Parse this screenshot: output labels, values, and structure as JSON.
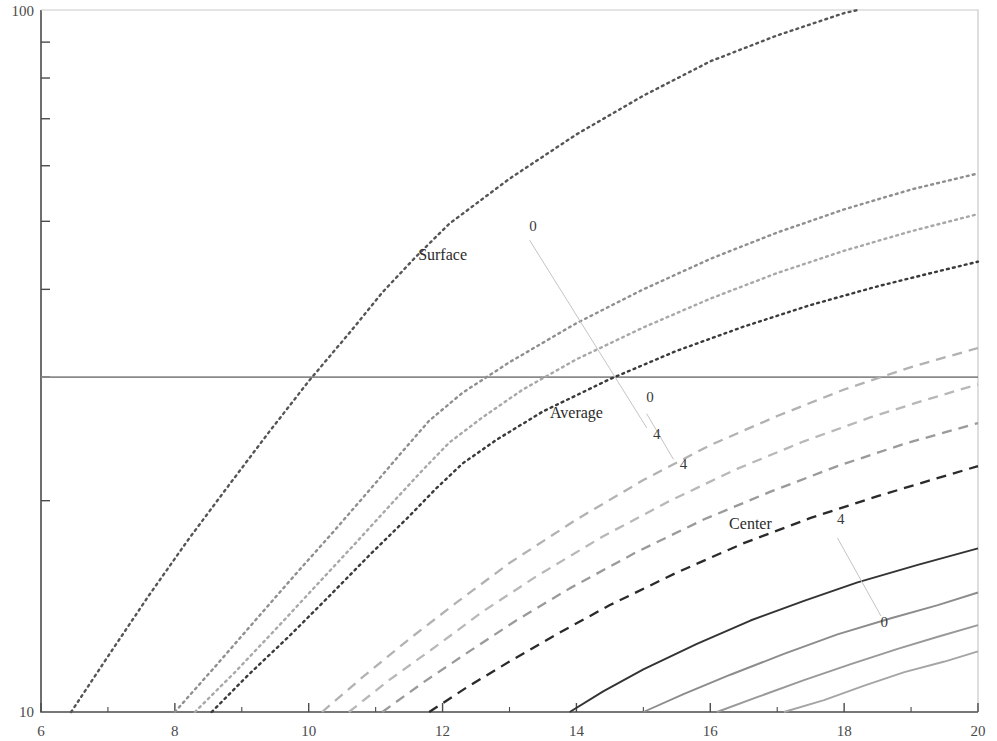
{
  "chart_data": {
    "type": "line",
    "title": "",
    "xlabel": "",
    "ylabel": "",
    "xlim": [
      6,
      20
    ],
    "ylim": [
      10,
      100
    ],
    "yscale": "log",
    "xscale": "linear",
    "grid": false,
    "legend_position": "inline-annotations",
    "x_ticks": [
      6,
      8,
      10,
      12,
      14,
      16,
      18,
      20
    ],
    "x_tick_labels": [
      "6",
      "8",
      "10",
      "12",
      "14",
      "16",
      "18",
      "20"
    ],
    "x_minor_ticks": [
      7,
      9,
      11,
      13,
      15,
      17,
      19
    ],
    "y_ticks": [
      10,
      100
    ],
    "y_tick_labels": [
      "10",
      "100"
    ],
    "y_minor_ticks": [
      20,
      30,
      40,
      50,
      60,
      70,
      80,
      90
    ],
    "reference_line": {
      "y": 30,
      "orientation": "horizontal",
      "color": "#8a8a8a"
    },
    "groups": [
      {
        "name": "Surface",
        "label": "Surface",
        "linestyle": "dotted",
        "label_x": 12.0,
        "label_y": 44.0,
        "tag_high": "0",
        "tag_high_x": 13.35,
        "tag_high_y": 48.5,
        "tag_low": "4",
        "tag_low_x": 15.2,
        "tag_low_y": 24.5,
        "series": [
          {
            "name": "0",
            "color": "#555555",
            "x": [
              6.45,
              7.0,
              7.6,
              8.2,
              8.8,
              9.4,
              10.0,
              10.6,
              11.1,
              11.6,
              12.1,
              13.0,
              14.0,
              15.0,
              16.0,
              17.0,
              18.0,
              19.0,
              20.0
            ],
            "y": [
              10.0,
              12.0,
              14.6,
              17.6,
              21.0,
              25.0,
              29.6,
              34.6,
              39.6,
              44.5,
              49.6,
              57.5,
              66.5,
              75.5,
              84.5,
              92.0,
              99.0,
              104.0,
              108.0
            ]
          },
          {
            "name": "1",
            "color": "#8f8f8f",
            "x": [
              8.0,
              8.6,
              9.2,
              9.8,
              10.4,
              11.0,
              11.4,
              11.8,
              12.3,
              13.0,
              14.0,
              15.0,
              16.0,
              17.0,
              18.0,
              19.0,
              20.0
            ],
            "y": [
              10.0,
              11.6,
              13.5,
              15.7,
              18.2,
              21.2,
              23.5,
              26.0,
              28.5,
              31.5,
              35.8,
              40.0,
              44.2,
              48.2,
              52.0,
              55.5,
              58.5
            ]
          },
          {
            "name": "2",
            "color": "#a8a8a8",
            "x": [
              8.3,
              8.9,
              9.5,
              10.1,
              10.7,
              11.3,
              11.7,
              12.1,
              12.6,
              13.2,
              14.0,
              15.0,
              16.0,
              17.0,
              18.0,
              19.0,
              20.0
            ],
            "y": [
              10.0,
              11.4,
              13.1,
              15.1,
              17.4,
              20.1,
              22.1,
              24.2,
              26.3,
              28.8,
              31.8,
              35.3,
              38.8,
              42.2,
              45.4,
              48.4,
              51.2
            ]
          },
          {
            "name": "4",
            "color": "#3a3a3a",
            "x": [
              8.55,
              9.1,
              9.7,
              10.3,
              10.9,
              11.5,
              11.9,
              12.3,
              12.8,
              13.5,
              14.5,
              15.5,
              16.5,
              17.5,
              18.5,
              19.3,
              20.0
            ],
            "y": [
              10.0,
              11.3,
              12.8,
              14.6,
              16.7,
              19.0,
              20.8,
              22.6,
              24.4,
              26.8,
              29.8,
              32.7,
              35.4,
              38.0,
              40.4,
              42.2,
              43.8
            ]
          }
        ]
      },
      {
        "name": "Average",
        "label": "Average",
        "linestyle": "dashed",
        "label_x": 14.0,
        "label_y": 26.2,
        "tag_high": "0",
        "tag_high_x": 15.1,
        "tag_high_y": 27.6,
        "tag_low": "4",
        "tag_low_x": 15.6,
        "tag_low_y": 22.2,
        "series": [
          {
            "name": "0",
            "color": "#b2b2b2",
            "x": [
              10.2,
              10.8,
              11.5,
              12.2,
              13.0,
              14.0,
              15.0,
              16.0,
              17.0,
              18.0,
              19.0,
              20.0
            ],
            "y": [
              10.0,
              11.2,
              12.7,
              14.3,
              16.3,
              18.8,
              21.4,
              24.0,
              26.4,
              28.8,
              31.0,
              33.0
            ]
          },
          {
            "name": "1",
            "color": "#b8b8b8",
            "x": [
              10.6,
              11.2,
              11.9,
              12.6,
              13.4,
              14.4,
              15.4,
              16.4,
              17.4,
              18.4,
              19.2,
              20.0
            ],
            "y": [
              10.0,
              11.1,
              12.4,
              13.9,
              15.6,
              17.8,
              20.0,
              22.2,
              24.3,
              26.3,
              27.8,
              29.3
            ]
          },
          {
            "name": "2",
            "color": "#9a9a9a",
            "x": [
              11.1,
              11.7,
              12.4,
              13.1,
              13.9,
              14.9,
              15.9,
              16.9,
              17.9,
              18.9,
              20.0
            ],
            "y": [
              10.0,
              11.0,
              12.2,
              13.5,
              15.0,
              16.9,
              18.8,
              20.6,
              22.4,
              24.1,
              25.8
            ]
          },
          {
            "name": "4",
            "color": "#2a2a2a",
            "x": [
              11.8,
              12.4,
              13.0,
              13.7,
              14.5,
              15.5,
              16.5,
              17.5,
              18.5,
              19.3,
              20.0
            ],
            "y": [
              10.0,
              10.9,
              11.8,
              12.9,
              14.2,
              15.8,
              17.4,
              18.9,
              20.3,
              21.4,
              22.4
            ]
          }
        ]
      },
      {
        "name": "Center",
        "label": "Center",
        "linestyle": "solid",
        "label_x": 16.6,
        "label_y": 18.2,
        "tag_high": "4",
        "tag_high_x": 17.95,
        "tag_high_y": 18.5,
        "tag_low": "0",
        "tag_low_x": 18.6,
        "tag_low_y": 13.2,
        "series": [
          {
            "name": "4",
            "color": "#333333",
            "x": [
              13.9,
              14.4,
              15.0,
              15.8,
              16.6,
              17.4,
              18.2,
              19.1,
              20.0
            ],
            "y": [
              10.0,
              10.7,
              11.5,
              12.5,
              13.5,
              14.4,
              15.3,
              16.2,
              17.1
            ]
          },
          {
            "name": "2",
            "color": "#8c8c8c",
            "x": [
              15.0,
              15.6,
              16.3,
              17.1,
              17.9,
              18.7,
              19.4,
              20.0
            ],
            "y": [
              10.0,
              10.6,
              11.3,
              12.1,
              12.9,
              13.6,
              14.2,
              14.8
            ]
          },
          {
            "name": "1",
            "color": "#999999",
            "x": [
              16.1,
              16.7,
              17.4,
              18.1,
              18.8,
              19.4,
              20.0
            ],
            "y": [
              10.0,
              10.5,
              11.1,
              11.7,
              12.3,
              12.8,
              13.3
            ]
          },
          {
            "name": "0",
            "color": "#a5a5a5",
            "x": [
              17.1,
              17.7,
              18.3,
              18.9,
              19.5,
              20.0
            ],
            "y": [
              10.0,
              10.4,
              10.9,
              11.4,
              11.8,
              12.2
            ]
          }
        ]
      }
    ],
    "annotations": [
      {
        "text": "Surface",
        "x": 12.0,
        "y": 44.0
      },
      {
        "text": "Average",
        "x": 14.0,
        "y": 26.2
      },
      {
        "text": "Center",
        "x": 16.6,
        "y": 18.2
      },
      {
        "text": "0",
        "x": 13.35,
        "y": 48.5
      },
      {
        "text": "4",
        "x": 15.2,
        "y": 24.5
      },
      {
        "text": "0",
        "x": 15.1,
        "y": 27.6
      },
      {
        "text": "4",
        "x": 15.6,
        "y": 22.2
      },
      {
        "text": "4",
        "x": 17.95,
        "y": 18.5
      },
      {
        "text": "0",
        "x": 18.6,
        "y": 13.2
      }
    ]
  },
  "axis": {
    "y_top_label": "100",
    "y_bottom_label": "10"
  },
  "colors": {
    "axis": "#4b4b4b",
    "reference_line": "#8a8a8a",
    "background": "#ffffff"
  }
}
